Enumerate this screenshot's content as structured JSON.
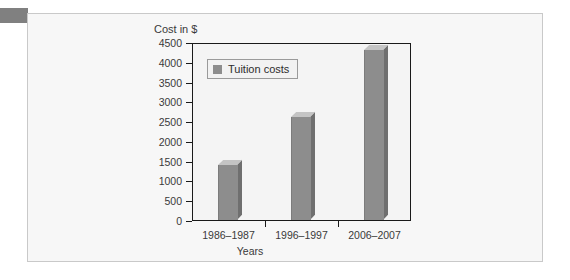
{
  "chart_data": {
    "type": "bar",
    "title": "",
    "categories": [
      "1986–1987",
      "1996–1997",
      "2006–2007"
    ],
    "values": [
      1400,
      2600,
      4300
    ],
    "series": [
      {
        "name": "Tuition costs",
        "values": [
          1400,
          2600,
          4300
        ]
      }
    ],
    "xlabel": "Years",
    "ylabel": "Cost in $",
    "ylim": [
      0,
      4500
    ],
    "ytick_step": 500,
    "yticks": [
      0,
      500,
      1000,
      1500,
      2000,
      2500,
      3000,
      3500,
      4000,
      4500
    ],
    "ytick_labels": [
      "0",
      "500",
      "1000",
      "1500",
      "2000",
      "2500",
      "3000",
      "3500",
      "4000",
      "4500"
    ],
    "grid": false,
    "legend": {
      "position": "top-left",
      "entries": [
        "Tuition costs"
      ]
    },
    "style": "3d-bars",
    "colors": {
      "bar_front": "#8d8d8d",
      "bar_top": "#c4c4c4",
      "bar_side": "#6f6f6f",
      "axis": "#1a1a1a",
      "plot_background": "#f4f4f4",
      "card_background": "#f7f7f7",
      "card_border": "#c9c9c9",
      "tab": "#808080",
      "text": "#3a3a3a"
    }
  },
  "figure": {
    "y_axis_title": "Cost in $",
    "x_axis_title": "Years",
    "legend_label": "Tuition costs"
  }
}
